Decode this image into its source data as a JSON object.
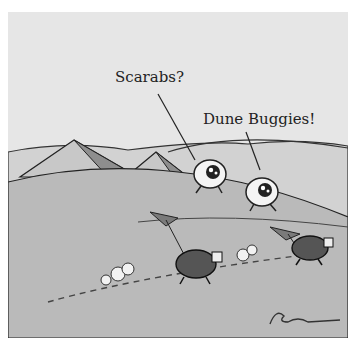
{
  "cartoon": {
    "speech": [
      {
        "speaker": "left-creature",
        "text": "Scarabs?"
      },
      {
        "speaker": "right-creature",
        "text": "Dune Buggies!"
      }
    ],
    "signature": "Rogan",
    "scene": "desert with pyramids, two big-eyed creatures watching two scarab beetles race across the sand",
    "colors": {
      "sky": "#e6e6e6",
      "sand": "#b9b9b9",
      "dune_far": "#cfcfcf",
      "ink": "#222222",
      "pyramid": "#c4c4c4",
      "pyramid_shade": "#8c8c8c"
    }
  }
}
